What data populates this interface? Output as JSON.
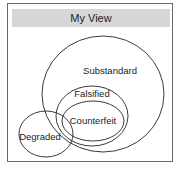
{
  "panel": {
    "title": "My View"
  },
  "diagram": {
    "type": "venn",
    "sets": [
      {
        "id": "substandard",
        "label": "Substandard"
      },
      {
        "id": "falsified",
        "label": "Falsified"
      },
      {
        "id": "counterfeit",
        "label": "Counterfeit"
      },
      {
        "id": "degraded",
        "label": "Degraded"
      }
    ],
    "stroke_color": "#3a3a3a",
    "title_bar_color": "#d6d6d6",
    "frame_color": "#6a6a6a"
  }
}
